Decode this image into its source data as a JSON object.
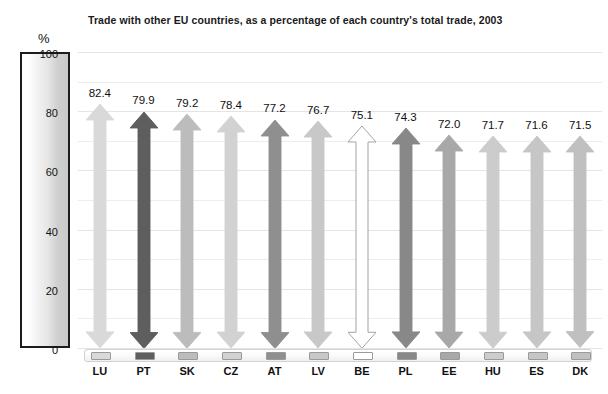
{
  "chart_data": {
    "type": "bar",
    "title": "Trade with other EU countries, as a percentage of each country's total trade, 2003",
    "xlabel": "",
    "ylabel": "%",
    "ylim": [
      0,
      100
    ],
    "grid": true,
    "legend": "none",
    "categories": [
      "LU",
      "PT",
      "SK",
      "CZ",
      "AT",
      "LV",
      "BE",
      "PL",
      "EE",
      "HU",
      "ES",
      "DK"
    ],
    "values": [
      82.4,
      79.9,
      79.2,
      78.4,
      77.2,
      76.7,
      75.1,
      74.3,
      72.0,
      71.7,
      71.6,
      71.5
    ],
    "value_labels": [
      "82.4",
      "79.9",
      "79.2",
      "78.4",
      "77.2",
      "76.7",
      "75.1",
      "74.3",
      "72.0",
      "71.7",
      "71.6",
      "71.5"
    ],
    "yticks": [
      0,
      20,
      40,
      60,
      80,
      100
    ],
    "ytick_labels": [
      "0",
      "20",
      "40",
      "60",
      "80",
      "100"
    ],
    "series_colors": [
      "#d9d9d9",
      "#5e5e5e",
      "#bcbcbc",
      "#d2d2d2",
      "#8f8f8f",
      "#c8c8c8",
      "#ffffff",
      "#888888",
      "#a8a8a8",
      "#cccccc",
      "#c6c6c6",
      "#c0c0c0"
    ],
    "marker_style": "double-headed-arrow"
  },
  "axis": {
    "unit_symbol": "%",
    "ticks": [
      {
        "label": "100",
        "value": 100
      },
      {
        "label": "80",
        "value": 80
      },
      {
        "label": "60",
        "value": 60
      },
      {
        "label": "40",
        "value": 40
      },
      {
        "label": "20",
        "value": 20
      },
      {
        "label": "0",
        "value": 0
      }
    ]
  },
  "colors": {
    "axis_box_border": "#1c1c1c",
    "gridline": "#ededed",
    "text": "#111111",
    "highlight_country": "#ffffff",
    "swatch_border": "#9a9a9a"
  }
}
